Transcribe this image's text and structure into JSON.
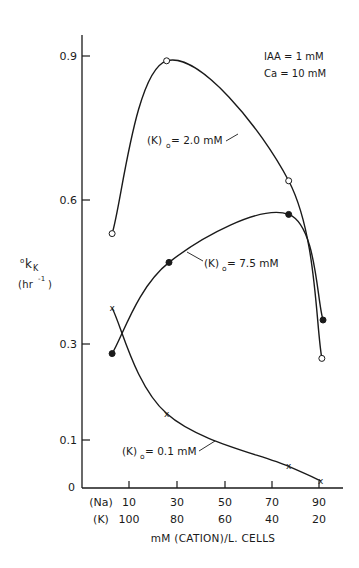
{
  "chart_data": {
    "type": "line",
    "title": "",
    "xlabel": "mM (CATION)/L. CELLS",
    "ylabel": "°k_K (hr⁻¹)",
    "ylabel_main": "k",
    "ylabel_prefix": "o",
    "ylabel_sub": "K",
    "ylabel_unit": "(hr",
    "ylabel_unit_sup": "-1",
    "ylabel_unit_close": ")",
    "ylim": [
      0,
      0.95
    ],
    "xlim": [
      0,
      105
    ],
    "grid": false,
    "yticks": [
      {
        "value": 0,
        "label": "0"
      },
      {
        "value": 0.1,
        "label": "0.1"
      },
      {
        "value": 0.3,
        "label": "0.3"
      },
      {
        "value": 0.6,
        "label": "0.6"
      },
      {
        "value": 0.9,
        "label": "0.9"
      }
    ],
    "xticks": {
      "row1_name": "(Na)",
      "row2_name": "(K)",
      "na_values": [
        10,
        30,
        50,
        70,
        90
      ],
      "k_values": [
        100,
        80,
        60,
        40,
        20
      ]
    },
    "annotations": [
      "IAA = 1 mM",
      "Ca = 10 mM"
    ],
    "series": [
      {
        "name": "(K)o = 2.0 mM",
        "label_prefix": "(K)",
        "label_sub": "o",
        "label_suffix": " = 2.0 mM",
        "marker": "open-circle",
        "x_na": [
          3,
          26,
          77.5,
          91.5
        ],
        "values": [
          0.53,
          0.89,
          0.64,
          0.27
        ]
      },
      {
        "name": "(K)o = 7.5 mM",
        "label_prefix": "(K)",
        "label_sub": "o",
        "label_suffix": " = 7.5 mM",
        "marker": "filled-circle",
        "x_na": [
          3,
          27,
          77.5,
          92
        ],
        "values": [
          0.28,
          0.47,
          0.57,
          0.35
        ]
      },
      {
        "name": "(K)o = 0.1 mM",
        "label_prefix": "(K)",
        "label_sub": "o",
        "label_suffix": " = 0.1 mM",
        "marker": "x",
        "x_na": [
          3,
          26,
          77.5,
          91
        ],
        "values": [
          0.375,
          0.155,
          0.045,
          0.015
        ]
      }
    ]
  }
}
